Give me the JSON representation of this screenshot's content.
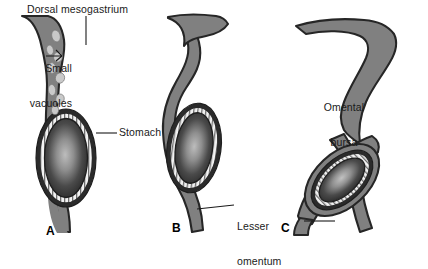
{
  "figure": {
    "background_color": "#ffffff",
    "width": 428,
    "height": 249
  },
  "colors": {
    "mesogastrium_fill": "#808080",
    "mesogastrium_outline": "#262626",
    "stomach_dark": "#262626",
    "stomach_highlight": "#b5b5b5",
    "epithelium_ring": "#f2f2f2",
    "vacuole_fill": "#c8c8c8",
    "label_text": "#1a1a1a",
    "leader_line": "#1a1a1a"
  },
  "labels": {
    "dorsal_mesogastrium": "Dorsal mesogastrium",
    "small_vacuoles_line1": "Small",
    "small_vacuoles_line2": "vacuoles",
    "stomach": "Stomach",
    "lesser_omentum_line1": "Lesser",
    "lesser_omentum_line2": "omentum",
    "omental_bursa_line1": "Omental",
    "omental_bursa_line2": "bursa"
  },
  "panels": [
    {
      "letter": "A",
      "name": "panel-a-early-stage",
      "description": "Vertical dorsal mesogastrium with small vacuoles and stomach",
      "features": [
        "Dorsal mesogastrium",
        "Small vacuoles",
        "Stomach"
      ],
      "vacuole_count": 8
    },
    {
      "letter": "B",
      "name": "panel-b-intermediate-stage",
      "description": "Stomach rotating, vacuoles coalescing, lesser omentum visible",
      "features": [
        "Stomach",
        "Lesser omentum"
      ],
      "vacuole_count": 0
    },
    {
      "letter": "C",
      "name": "panel-c-late-stage",
      "description": "Stomach rotated, omental bursa formed behind stomach",
      "features": [
        "Omental bursa",
        "Lesser omentum"
      ],
      "vacuole_count": 0
    }
  ]
}
